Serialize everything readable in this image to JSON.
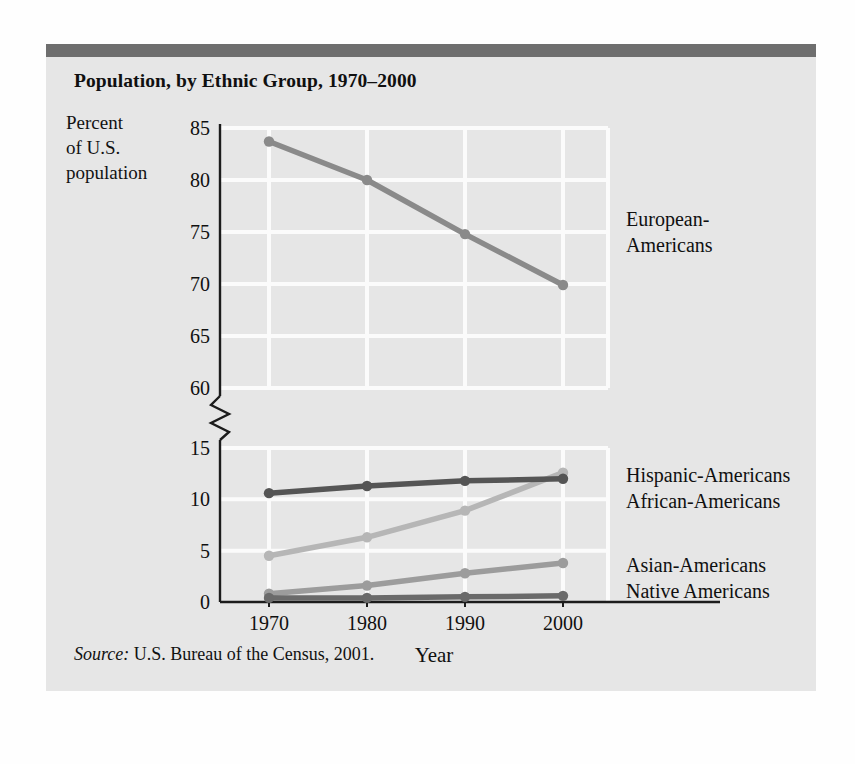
{
  "panel": {
    "title": "Population, by Ethnic Group, 1970–2000",
    "y_axis_caption": "Percent of U.S. population",
    "y_axis_caption_lines": [
      "Percent",
      "of U.S.",
      "population"
    ],
    "source_keyword": "Source:",
    "source_text": " U.S. Bureau of the Census, 2001."
  },
  "colors": {
    "page_background": "#fefefe",
    "panel_background": "#e6e6e6",
    "top_bar": "#6e6e6e",
    "gridline": "#fbfbfb",
    "axis": "#1c1c1c",
    "text": "#101010",
    "european": "#8a8a8a",
    "african": "#555555",
    "hispanic": "#b6b6b6",
    "asian": "#9c9c9c",
    "native": "#6a6a6a"
  },
  "chart_data": {
    "type": "line",
    "title": "Population, by Ethnic Group, 1970–2000",
    "xlabel": "Year",
    "ylabel": "Percent of U.S. population",
    "x": [
      1970,
      1980,
      1990,
      2000
    ],
    "xtick_labels": [
      "1970",
      "1980",
      "1990",
      "2000"
    ],
    "ytick_labels_upper": [
      "85",
      "80",
      "75",
      "70",
      "65",
      "60"
    ],
    "ytick_labels_lower": [
      "15",
      "10",
      "5",
      "0"
    ],
    "ylim_lower": [
      0,
      15
    ],
    "ylim_upper": [
      60,
      85
    ],
    "axis_break": true,
    "grid": true,
    "legend_position": "right-inline",
    "series": [
      {
        "name": "European-Americans",
        "label": "European-Americans",
        "label_lines": [
          "European-",
          "Americans"
        ],
        "color": "#8a8a8a",
        "values": [
          83.7,
          80.0,
          74.8,
          69.9
        ]
      },
      {
        "name": "Hispanic-Americans",
        "label": "Hispanic-Americans",
        "label_lines": [
          "Hispanic-Americans"
        ],
        "color": "#b6b6b6",
        "values": [
          4.5,
          6.3,
          8.9,
          12.6
        ]
      },
      {
        "name": "African-Americans",
        "label": "African-Americans",
        "label_lines": [
          "African-Americans"
        ],
        "color": "#555555",
        "values": [
          10.6,
          11.3,
          11.8,
          12.0
        ]
      },
      {
        "name": "Asian-Americans",
        "label": "Asian-Americans",
        "label_lines": [
          "Asian-Americans"
        ],
        "color": "#9c9c9c",
        "values": [
          0.8,
          1.6,
          2.8,
          3.8
        ]
      },
      {
        "name": "Native Americans",
        "label": "Native Americans",
        "label_lines": [
          "Native Americans"
        ],
        "color": "#6a6a6a",
        "values": [
          0.4,
          0.4,
          0.5,
          0.6
        ]
      }
    ],
    "source": "Source: U.S. Bureau of the Census, 2001."
  }
}
